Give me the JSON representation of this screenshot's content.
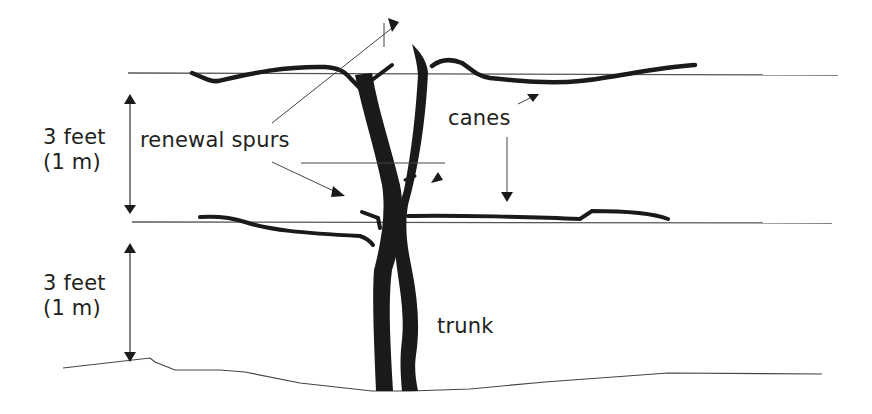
{
  "diagram": {
    "labels": {
      "upper_height": {
        "line1": "3 feet",
        "line2": "(1 m)"
      },
      "lower_height": {
        "line1": "3 feet",
        "line2": "(1 m)"
      },
      "renewal_spurs": "renewal spurs",
      "canes": "canes",
      "trunk": "trunk"
    },
    "colors": {
      "ink": "#1a1a1a",
      "line": "#555555",
      "text": "#231f20",
      "background": "#ffffff"
    }
  }
}
